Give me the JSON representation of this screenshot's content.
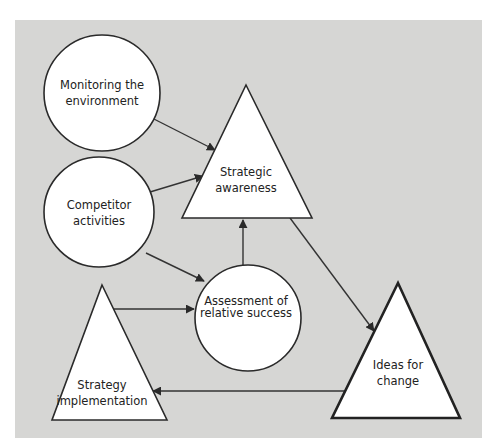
{
  "diagram": {
    "type": "flow",
    "background_color": "#d6d6d4",
    "nodes": [
      {
        "id": "monitoring",
        "shape": "circle",
        "lines": [
          "Monitoring the",
          "environment"
        ]
      },
      {
        "id": "awareness",
        "shape": "triangle",
        "lines": [
          "Strategic",
          "awareness"
        ]
      },
      {
        "id": "competitor",
        "shape": "circle",
        "lines": [
          "Competitor",
          "activities"
        ]
      },
      {
        "id": "assessment",
        "shape": "circle",
        "lines": [
          "Assessment of",
          "relative success"
        ]
      },
      {
        "id": "implementation",
        "shape": "triangle",
        "lines": [
          "Strategy",
          "implementation"
        ]
      },
      {
        "id": "ideas",
        "shape": "triangle",
        "lines": [
          "Ideas for",
          "change"
        ]
      }
    ],
    "edges": [
      {
        "from": "monitoring",
        "to": "awareness"
      },
      {
        "from": "competitor",
        "to": "awareness"
      },
      {
        "from": "competitor",
        "to": "assessment"
      },
      {
        "from": "assessment",
        "to": "awareness"
      },
      {
        "from": "awareness",
        "to": "ideas"
      },
      {
        "from": "implementation",
        "to": "assessment"
      },
      {
        "from": "ideas",
        "to": "implementation"
      }
    ]
  }
}
